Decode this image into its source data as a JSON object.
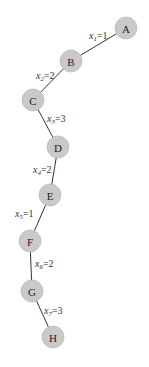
{
  "diagram": {
    "type": "path-tree",
    "node_color": "#c9c9c9",
    "edge_color": "#333333",
    "nodes": [
      {
        "id": "A",
        "label": "A",
        "x": 126,
        "y": 28
      },
      {
        "id": "B",
        "label": "B",
        "x": 71,
        "y": 61
      },
      {
        "id": "C",
        "label": "C",
        "x": 33,
        "y": 100
      },
      {
        "id": "D",
        "label": "D",
        "x": 58,
        "y": 147
      },
      {
        "id": "E",
        "label": "E",
        "x": 50,
        "y": 195
      },
      {
        "id": "F",
        "label": "F",
        "x": 30,
        "y": 241
      },
      {
        "id": "G",
        "label": "G",
        "x": 32,
        "y": 291
      },
      {
        "id": "H",
        "label": "H",
        "x": 53,
        "y": 337
      }
    ],
    "edges": [
      {
        "from": "A",
        "to": "B",
        "var": "x",
        "sub": "1",
        "value": "=1",
        "lx": 89,
        "ly": 39
      },
      {
        "from": "B",
        "to": "C",
        "var": "x",
        "sub": "2",
        "value": "=2",
        "lx": 36,
        "ly": 79
      },
      {
        "from": "C",
        "to": "D",
        "var": "x",
        "sub": "3",
        "value": "=3",
        "lx": 47,
        "ly": 122
      },
      {
        "from": "D",
        "to": "E",
        "var": "x",
        "sub": "4",
        "value": "=2",
        "lx": 33,
        "ly": 173
      },
      {
        "from": "E",
        "to": "F",
        "var": "x",
        "sub": "5",
        "value": "=1",
        "lx": 15,
        "ly": 217
      },
      {
        "from": "F",
        "to": "G",
        "var": "x",
        "sub": "6",
        "value": "=2",
        "lx": 35,
        "ly": 267
      },
      {
        "from": "G",
        "to": "H",
        "var": "x",
        "sub": "7",
        "value": "=3",
        "lx": 44,
        "ly": 314
      }
    ]
  }
}
